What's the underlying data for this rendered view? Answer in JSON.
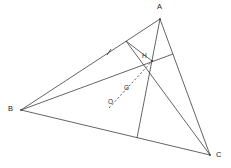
{
  "figure": {
    "background_color": "#ffffff",
    "stroke_color": "#3c3c3c",
    "label_color": "#1a1a1a",
    "width": 231,
    "height": 168
  },
  "vertices": [
    {
      "id": "A",
      "label": "A",
      "x": 160,
      "y": 19,
      "label_x": 158,
      "label_y": 5
    },
    {
      "id": "B",
      "label": "B",
      "x": 21,
      "y": 110,
      "label_x": 8,
      "label_y": 106
    },
    {
      "id": "C",
      "label": "C",
      "x": 210,
      "y": 155,
      "label_x": 216,
      "label_y": 152
    }
  ],
  "points": [
    {
      "id": "H",
      "label": "H",
      "x": 152,
      "y": 61,
      "label_x": 143,
      "label_y": 55
    },
    {
      "id": "G",
      "label": "G",
      "x": 130,
      "y": 90,
      "label_x": 124,
      "label_y": 86
    },
    {
      "id": "O",
      "label": "O",
      "x": 114,
      "y": 103,
      "label_x": 109,
      "label_y": 100
    }
  ],
  "segments": [
    {
      "name": "side-AB",
      "from": "A",
      "to": "B",
      "x1": 160,
      "y1": 19,
      "x2": 21,
      "y2": 110,
      "style": "solid"
    },
    {
      "name": "side-BC",
      "from": "B",
      "to": "C",
      "x1": 21,
      "y1": 110,
      "x2": 210,
      "y2": 155,
      "style": "solid"
    },
    {
      "name": "side-CA",
      "from": "C",
      "to": "A",
      "x1": 210,
      "y1": 155,
      "x2": 160,
      "y2": 19,
      "style": "solid"
    },
    {
      "name": "cevian-B-to-AC",
      "from": "B",
      "to": "foot-on-AC",
      "x1": 21,
      "y1": 110,
      "x2": 173,
      "y2": 54,
      "style": "solid"
    },
    {
      "name": "cevian-A-to-BC",
      "from": "A",
      "to": "foot-on-BC",
      "x1": 160,
      "y1": 19,
      "x2": 137,
      "y2": 138,
      "style": "solid"
    },
    {
      "name": "cevian-C-to-AB",
      "from": "C",
      "to": "foot-on-AB",
      "x1": 210,
      "y1": 155,
      "x2": 126,
      "y2": 41,
      "style": "solid"
    },
    {
      "name": "altitude-foot-connector",
      "from": "foot-on-AB",
      "to": "H",
      "x1": 126,
      "y1": 41,
      "x2": 152,
      "y2": 61,
      "style": "solid"
    },
    {
      "name": "euler-line",
      "from": "O",
      "to": "H",
      "x1": 109,
      "y1": 108,
      "x2": 152,
      "y2": 61,
      "style": "dashed"
    }
  ],
  "tick_marks": [
    {
      "name": "tick-on-AB",
      "x": 109,
      "y": 52,
      "angle": -33
    }
  ]
}
